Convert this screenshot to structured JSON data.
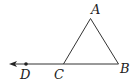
{
  "diagram": {
    "type": "geometry",
    "stroke_color": "#333333",
    "points": {
      "A": {
        "label": "A",
        "x": 90.5,
        "y": 18.5,
        "label_x": 91,
        "label_y": 14
      },
      "B": {
        "label": "B",
        "x": 118.5,
        "y": 64,
        "label_x": 120,
        "label_y": 73
      },
      "C": {
        "label": "C",
        "x": 63.5,
        "y": 64,
        "label_x": 54,
        "label_y": 79
      },
      "D": {
        "label": "D",
        "x": 26,
        "y": 64,
        "label_x": 20,
        "label_y": 79
      }
    },
    "segments": [
      {
        "from": "A",
        "to": "B"
      },
      {
        "from": "A",
        "to": "C"
      },
      {
        "from": "B",
        "to": "C"
      }
    ],
    "ray": {
      "from": "B",
      "through": "D",
      "arrow_tip_x": 9,
      "arrow_tip_y": 64
    }
  }
}
